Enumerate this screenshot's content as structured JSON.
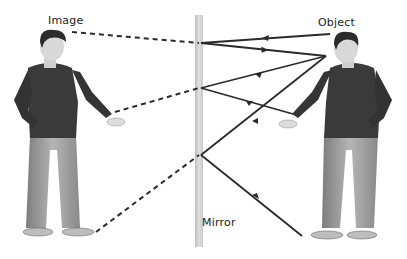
{
  "diagram": {
    "labels": {
      "image": "Image",
      "object": "Object",
      "mirror": "Mirror"
    },
    "colors": {
      "ray": "#2a2a2a",
      "mirror": "#cfcfcf",
      "mirror_edge": "#e6e6e6",
      "shirt": "#3a3a3a",
      "jeans": "#9a9a9a",
      "skin": "#d9d9d9",
      "hair": "#2b2b2b",
      "shoe": "#c4c4c4"
    }
  }
}
